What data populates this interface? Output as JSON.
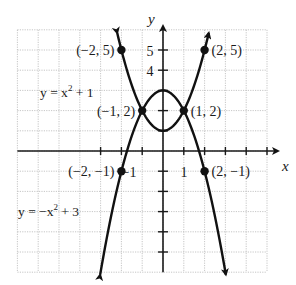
{
  "figure": {
    "top_caption_cut": "",
    "axes": {
      "x_label": "x",
      "y_label": "y",
      "x_range": [
        -7,
        5
      ],
      "y_range": [
        -6,
        6
      ],
      "tick_labels": {
        "x": [
          {
            "value": -1,
            "text": "−1"
          },
          {
            "value": 1,
            "text": "1"
          }
        ],
        "y": [
          {
            "value": 5,
            "text": "5"
          },
          {
            "value": 4,
            "text": "4"
          }
        ]
      }
    },
    "curves": [
      {
        "name": "y = x² + 1",
        "equation_label": "y = x",
        "exponent": "2",
        "tail": " + 1",
        "a": 1,
        "c": 1,
        "x_from": -2.2,
        "x_to": 2.2
      },
      {
        "name": "y = −x² + 3",
        "equation_label": "y = −x",
        "exponent": "2",
        "tail": " + 3",
        "a": -1,
        "c": 3,
        "x_from": -3.02,
        "x_to": 3.02
      }
    ],
    "points": [
      {
        "x": -2,
        "y": 5,
        "label": "(−2, 5)",
        "side": "left"
      },
      {
        "x": 2,
        "y": 5,
        "label": "(2, 5)",
        "side": "right"
      },
      {
        "x": -1,
        "y": 2,
        "label": "(−1, 2)",
        "side": "left"
      },
      {
        "x": 1,
        "y": 2,
        "label": "(1, 2)",
        "side": "right"
      },
      {
        "x": -2,
        "y": -1,
        "label": "(−2, −1)",
        "side": "left"
      },
      {
        "x": 2,
        "y": -1,
        "label": "(2, −1)",
        "side": "right"
      }
    ]
  },
  "colors": {
    "curve": "#111111",
    "grid": "#b8b8b8",
    "axis": "#1a1a1a"
  }
}
